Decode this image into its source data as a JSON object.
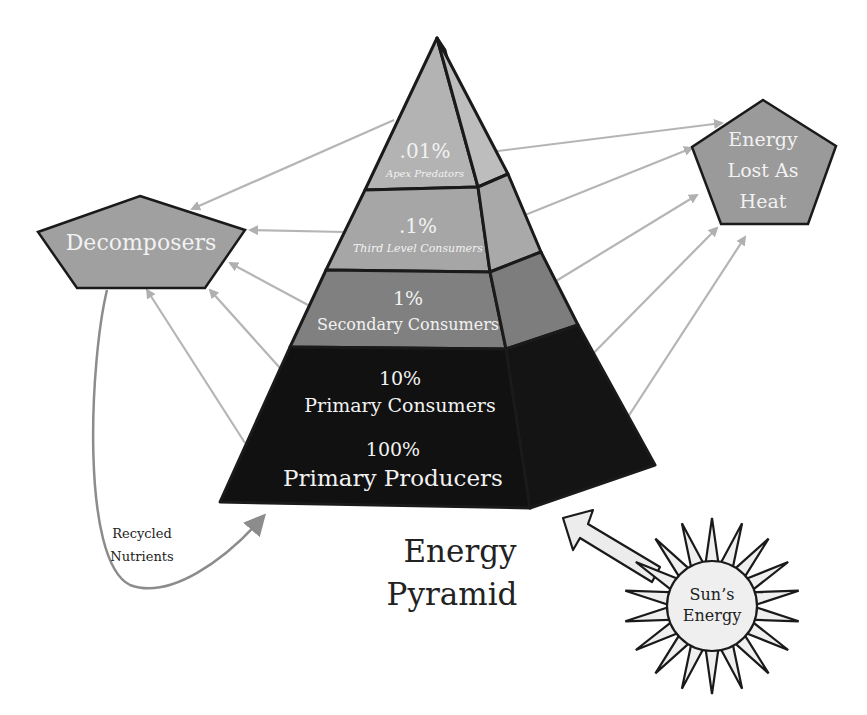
{
  "title": {
    "line1": "Energy",
    "line2": "Pyramid"
  },
  "pyramid": {
    "levels": [
      {
        "percent": ".01%",
        "name": "Apex Predators",
        "color": "#b3b3b3"
      },
      {
        "percent": ".1%",
        "name": "Third Level Consumers",
        "color": "#a6a6a6"
      },
      {
        "percent": "1%",
        "name": "Secondary Consumers",
        "color": "#808080"
      },
      {
        "percent": "10%",
        "name": "Primary Consumers",
        "color": "#111111"
      },
      {
        "percent": "100%",
        "name": "Primary Producers",
        "color": "#111111"
      }
    ]
  },
  "decomposers": {
    "label": "Decomposers",
    "fill": "#a0a0a0"
  },
  "heat": {
    "line1": "Energy",
    "line2": "Lost As",
    "line3": "Heat",
    "fill": "#9a9a9a"
  },
  "recycled": {
    "line1": "Recycled",
    "line2": "Nutrients"
  },
  "sun": {
    "line1": "Sun’s",
    "line2": "Energy",
    "fill": "#efefef"
  },
  "colors": {
    "arrow": "#b5b5b5",
    "outline": "#1a1a1a"
  }
}
